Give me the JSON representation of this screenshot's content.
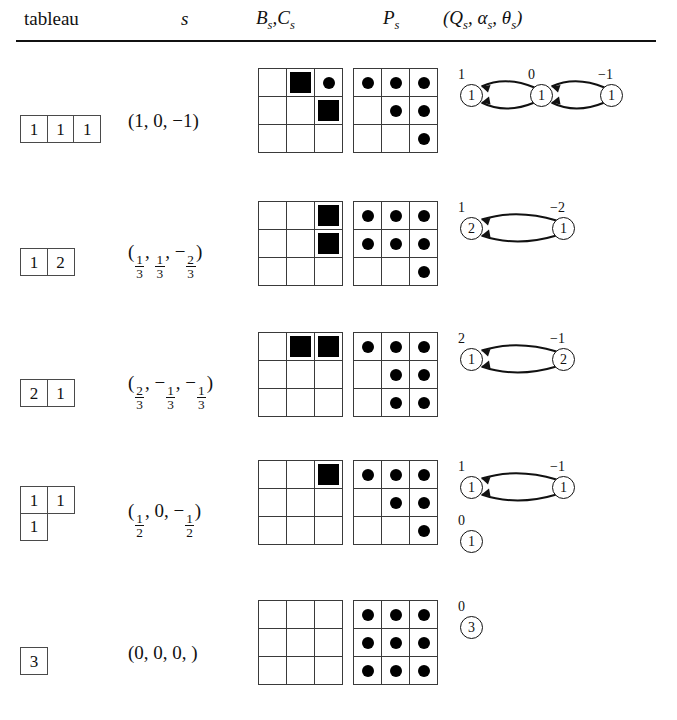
{
  "header": {
    "col_tableau": "tableau",
    "col_s": "s",
    "col_bc_b": "B",
    "col_bc_sub1": "s",
    "col_bc_sep": ",",
    "col_bc_c": "C",
    "col_bc_sub2": "s",
    "col_p": "P",
    "col_p_sub": "s",
    "col_q": "(Q",
    "col_q_sub": "s",
    "col_alpha": ", α",
    "col_alpha_sub": "s",
    "col_theta": ", θ",
    "col_theta_sub": "s",
    "col_q_close": ")"
  },
  "rows": [
    {
      "id": "row-1",
      "tableau": {
        "shape": [
          [
            "1",
            "1",
            "1"
          ]
        ]
      },
      "s_vector": {
        "text": "(1, 0, −1)",
        "parts": [
          "1",
          "0",
          "−1"
        ]
      },
      "bc_grid": [
        [
          "",
          "sq",
          "dot"
        ],
        [
          "",
          "",
          "sq"
        ],
        [
          "",
          "",
          ""
        ]
      ],
      "p_grid": [
        [
          "dot",
          "dot",
          "dot"
        ],
        [
          "",
          "dot",
          "dot"
        ],
        [
          "",
          "",
          "dot"
        ]
      ],
      "quiver": {
        "nodes": [
          {
            "value": "1",
            "label": "1",
            "x": 8,
            "y": 24
          },
          {
            "value": "1",
            "label": "0",
            "x": 78,
            "y": 24
          },
          {
            "value": "1",
            "label": "−1",
            "x": 148,
            "y": 24
          }
        ],
        "edges": [
          {
            "from": 1,
            "to": 0,
            "pair": "double"
          },
          {
            "from": 2,
            "to": 1,
            "pair": "double"
          }
        ]
      }
    },
    {
      "id": "row-2",
      "tableau": {
        "shape": [
          [
            "1",
            "2"
          ]
        ]
      },
      "s_vector": {
        "text": "(1/3, 1/3, −2/3)",
        "parts": [
          "1/3",
          "1/3",
          "−2/3"
        ]
      },
      "bc_grid": [
        [
          "",
          "",
          "sq"
        ],
        [
          "",
          "",
          "sq"
        ],
        [
          "",
          "",
          ""
        ]
      ],
      "p_grid": [
        [
          "dot",
          "dot",
          "dot"
        ],
        [
          "dot",
          "dot",
          "dot"
        ],
        [
          "",
          "",
          "dot"
        ]
      ],
      "quiver": {
        "nodes": [
          {
            "value": "2",
            "label": "1",
            "x": 8,
            "y": 24
          },
          {
            "value": "1",
            "label": "−2",
            "x": 100,
            "y": 24
          }
        ],
        "edges": [
          {
            "from": 1,
            "to": 0,
            "pair": "double"
          }
        ]
      }
    },
    {
      "id": "row-3",
      "tableau": {
        "shape": [
          [
            "2",
            "1"
          ]
        ]
      },
      "s_vector": {
        "text": "(2/3, −1/3, −1/3)",
        "parts": [
          "2/3",
          "−1/3",
          "−1/3"
        ]
      },
      "bc_grid": [
        [
          "",
          "sq",
          "sq"
        ],
        [
          "",
          "",
          ""
        ],
        [
          "",
          "",
          ""
        ]
      ],
      "p_grid": [
        [
          "dot",
          "dot",
          "dot"
        ],
        [
          "",
          "dot",
          "dot"
        ],
        [
          "",
          "dot",
          "dot"
        ]
      ],
      "quiver": {
        "nodes": [
          {
            "value": "1",
            "label": "2",
            "x": 8,
            "y": 24
          },
          {
            "value": "2",
            "label": "−1",
            "x": 100,
            "y": 24
          }
        ],
        "edges": [
          {
            "from": 1,
            "to": 0,
            "pair": "double"
          }
        ]
      }
    },
    {
      "id": "row-4",
      "tableau": {
        "shape": [
          [
            "1",
            "1"
          ],
          [
            "1"
          ]
        ]
      },
      "s_vector": {
        "text": "(1/2, 0, −1/2)",
        "parts": [
          "1/2",
          "0",
          "−1/2"
        ]
      },
      "bc_grid": [
        [
          "",
          "",
          "sq"
        ],
        [
          "",
          "",
          ""
        ],
        [
          "",
          "",
          ""
        ]
      ],
      "p_grid": [
        [
          "dot",
          "dot",
          "dot"
        ],
        [
          "",
          "dot",
          "dot"
        ],
        [
          "",
          "",
          "dot"
        ]
      ],
      "quiver": {
        "nodes": [
          {
            "value": "1",
            "label": "1",
            "x": 8,
            "y": 24
          },
          {
            "value": "1",
            "label": "−1",
            "x": 100,
            "y": 24
          },
          {
            "value": "1",
            "label": "0",
            "x": 8,
            "y": 78
          }
        ],
        "edges": [
          {
            "from": 1,
            "to": 0,
            "pair": "double"
          }
        ]
      }
    },
    {
      "id": "row-5",
      "tableau": {
        "shape": [
          [
            "3"
          ]
        ]
      },
      "s_vector": {
        "text": "(0, 0, 0, )",
        "parts": [
          "0",
          "0",
          "0",
          ""
        ]
      },
      "bc_grid": [
        [
          "",
          "",
          ""
        ],
        [
          "",
          "",
          ""
        ],
        [
          "",
          "",
          ""
        ]
      ],
      "p_grid": [
        [
          "dot",
          "dot",
          "dot"
        ],
        [
          "dot",
          "dot",
          "dot"
        ],
        [
          "dot",
          "dot",
          "dot"
        ]
      ],
      "quiver": {
        "nodes": [
          {
            "value": "3",
            "label": "0",
            "x": 8,
            "y": 24
          }
        ],
        "edges": []
      }
    }
  ],
  "layout": {
    "row_tops": [
      60,
      193,
      324,
      452,
      592
    ],
    "grid_left_bc": 258,
    "grid_left_p": 353,
    "quiver_left": 452
  }
}
